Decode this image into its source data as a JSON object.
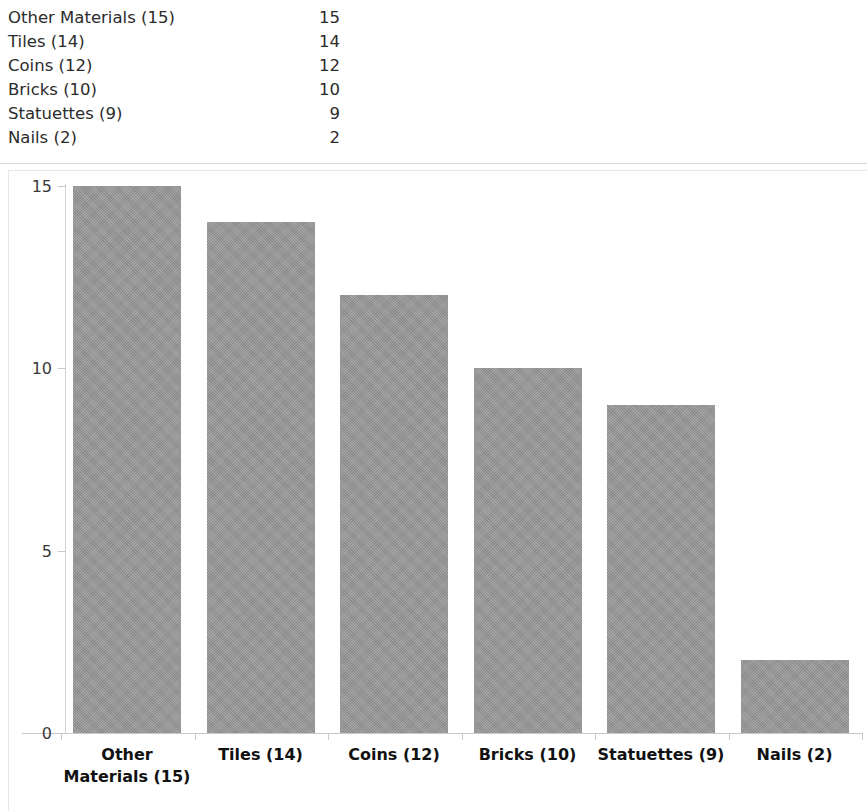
{
  "table": {
    "rows": [
      {
        "label": "Other Materials (15)",
        "value": "15"
      },
      {
        "label": "Tiles (14)",
        "value": "14"
      },
      {
        "label": "Coins (12)",
        "value": "12"
      },
      {
        "label": "Bricks (10)",
        "value": "10"
      },
      {
        "label": "Statuettes (9)",
        "value": "9"
      },
      {
        "label": "Nails (2)",
        "value": "2"
      }
    ]
  },
  "chart_data": {
    "type": "bar",
    "title": "",
    "xlabel": "",
    "ylabel": "",
    "categories": [
      "Other Materials (15)",
      "Tiles (14)",
      "Coins (12)",
      "Bricks (10)",
      "Statuettes (9)",
      "Nails (2)"
    ],
    "values": [
      15,
      14,
      12,
      10,
      9,
      2
    ],
    "ylim": [
      0,
      15
    ],
    "yticks": [
      "0",
      "5",
      "10",
      "15"
    ],
    "ytick_values": [
      0,
      5,
      10,
      15
    ],
    "grid": false,
    "legend": false,
    "bar_color": "#969696",
    "axis_color": "#c8c8c8"
  }
}
